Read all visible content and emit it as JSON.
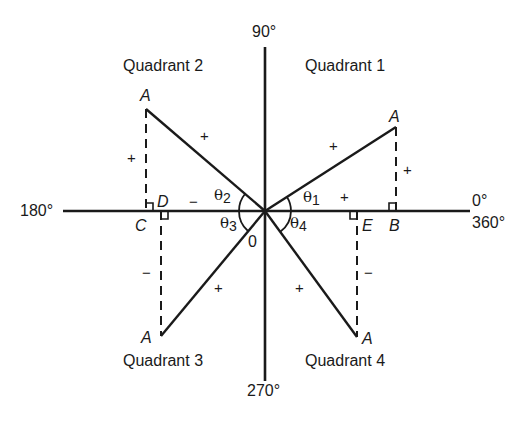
{
  "axes": {
    "top": "90°",
    "bottom": "270°",
    "left": "180°",
    "right_upper": "0°",
    "right_lower": "360°",
    "origin": "0"
  },
  "quadrants": [
    {
      "id": 1,
      "label": "Quadrant 1",
      "point": "A",
      "foot": "B",
      "angle_symbol": "θ",
      "angle_index": "1",
      "hyp_sign": "+",
      "opp_sign": "+",
      "adj_sign": "+"
    },
    {
      "id": 2,
      "label": "Quadrant 2",
      "point": "A",
      "foot": "D",
      "foot_alt": "C",
      "angle_symbol": "θ",
      "angle_index": "2",
      "hyp_sign": "+",
      "opp_sign": "+",
      "adj_sign": "−"
    },
    {
      "id": 3,
      "label": "Quadrant 3",
      "point": "A",
      "foot": "C",
      "angle_symbol": "θ",
      "angle_index": "3",
      "hyp_sign": "+",
      "opp_sign": "−"
    },
    {
      "id": 4,
      "label": "Quadrant 4",
      "point": "A",
      "foot": "E",
      "angle_symbol": "θ",
      "angle_index": "4",
      "hyp_sign": "+",
      "opp_sign": "−"
    }
  ],
  "colors": {
    "ink": "#1a1a1a",
    "background": "#ffffff"
  }
}
